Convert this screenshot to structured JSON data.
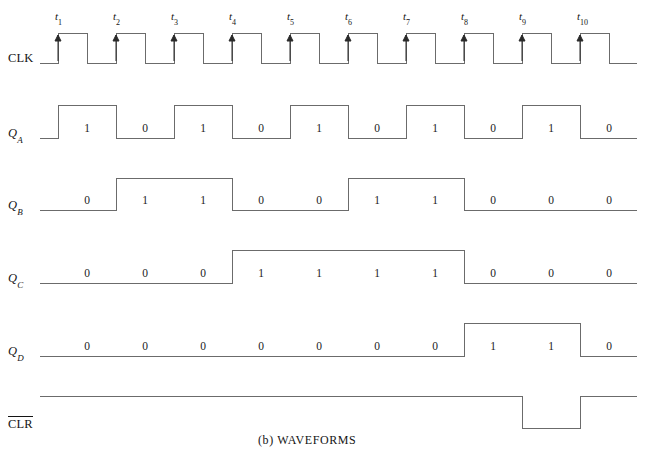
{
  "figure": {
    "caption": "(b)  WAVEFORMS",
    "type": "digital-timing-diagram",
    "line_color": "#6b6b6b",
    "text_color": "#141414",
    "background": "#ffffff"
  },
  "time_axis": {
    "tick_prefix": "t",
    "ticks": [
      "1",
      "2",
      "3",
      "4",
      "5",
      "6",
      "7",
      "8",
      "9",
      "10"
    ],
    "tick_x": [
      58,
      116,
      174,
      232,
      290,
      348,
      406,
      464,
      522,
      580
    ],
    "edge_marker": "rising-edge-arrow"
  },
  "signals": [
    {
      "key": "clk",
      "label": "CLK",
      "label_html": "CLK",
      "overbar": false,
      "subscript": "",
      "row_top_y": 33,
      "row_bottom_y": 63,
      "start_x": 40,
      "end_x": 637,
      "initial_level": 0,
      "kind": "clock",
      "show_bits": false,
      "bits": []
    },
    {
      "key": "qa",
      "label": "QA",
      "label_html": "Q",
      "subscript": "A",
      "overbar": false,
      "row_top_y": 105,
      "row_bottom_y": 138,
      "start_x": 40,
      "end_x": 637,
      "initial_level": 0,
      "kind": "data",
      "show_bits": true,
      "bits": [
        "1",
        "0",
        "1",
        "0",
        "1",
        "0",
        "1",
        "0",
        "1",
        "0"
      ]
    },
    {
      "key": "qb",
      "label": "QB",
      "label_html": "Q",
      "subscript": "B",
      "overbar": false,
      "row_top_y": 178,
      "row_bottom_y": 210,
      "start_x": 40,
      "end_x": 637,
      "initial_level": 0,
      "kind": "data",
      "show_bits": true,
      "bits": [
        "0",
        "1",
        "1",
        "0",
        "0",
        "1",
        "1",
        "0",
        "0",
        "0"
      ]
    },
    {
      "key": "qc",
      "label": "QC",
      "label_html": "Q",
      "subscript": "C",
      "overbar": false,
      "row_top_y": 250,
      "row_bottom_y": 283,
      "start_x": 40,
      "end_x": 637,
      "initial_level": 0,
      "kind": "data",
      "show_bits": true,
      "bits": [
        "0",
        "0",
        "0",
        "1",
        "1",
        "1",
        "1",
        "0",
        "0",
        "0"
      ]
    },
    {
      "key": "qd",
      "label": "QD",
      "label_html": "Q",
      "subscript": "D",
      "overbar": false,
      "row_top_y": 323,
      "row_bottom_y": 356,
      "start_x": 40,
      "end_x": 637,
      "initial_level": 0,
      "kind": "data",
      "show_bits": true,
      "bits": [
        "0",
        "0",
        "0",
        "0",
        "0",
        "0",
        "0",
        "1",
        "1",
        "0"
      ]
    },
    {
      "key": "clr",
      "label": "CLR",
      "label_html": "CLR",
      "subscript": "",
      "overbar": true,
      "row_top_y": 396,
      "row_bottom_y": 428,
      "start_x": 40,
      "end_x": 637,
      "initial_level": 1,
      "kind": "data",
      "show_bits": false,
      "bits": [
        "1",
        "1",
        "1",
        "1",
        "1",
        "1",
        "1",
        "1",
        "0",
        "1"
      ]
    }
  ],
  "chart_data": {
    "type": "line",
    "title": "(b)  WAVEFORMS",
    "xlabel": "",
    "ylabel": "",
    "x": [
      "t1",
      "t2",
      "t3",
      "t4",
      "t5",
      "t6",
      "t7",
      "t8",
      "t9",
      "t10"
    ],
    "series": [
      {
        "name": "CLK",
        "values": [
          1,
          1,
          1,
          1,
          1,
          1,
          1,
          1,
          1,
          1
        ]
      },
      {
        "name": "QA",
        "values": [
          1,
          0,
          1,
          0,
          1,
          0,
          1,
          0,
          1,
          0
        ]
      },
      {
        "name": "QB",
        "values": [
          0,
          1,
          1,
          0,
          0,
          1,
          1,
          0,
          0,
          0
        ]
      },
      {
        "name": "QC",
        "values": [
          0,
          0,
          0,
          1,
          1,
          1,
          1,
          0,
          0,
          0
        ]
      },
      {
        "name": "QD",
        "values": [
          0,
          0,
          0,
          0,
          0,
          0,
          0,
          1,
          1,
          0
        ]
      },
      {
        "name": "CLR",
        "values": [
          1,
          1,
          1,
          1,
          1,
          1,
          1,
          1,
          0,
          1
        ]
      }
    ],
    "grid": false,
    "legend": "left-axis-labels"
  }
}
